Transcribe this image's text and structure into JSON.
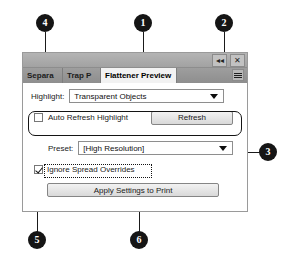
{
  "panel": {
    "titlebar": {
      "collapse_label": "◂◂",
      "close_label": "✕"
    },
    "tabs": [
      {
        "label": "Separa",
        "active": false
      },
      {
        "label": "Trap P",
        "active": false
      },
      {
        "label": "Flattener Preview",
        "active": true
      }
    ],
    "panel_menu_icon": "panel-menu-icon",
    "highlight": {
      "label": "Highlight:",
      "value": "Transparent Objects",
      "caret_icon": "chevron-down-icon"
    },
    "auto_refresh": {
      "label": "Auto Refresh Highlight",
      "checked": false,
      "refresh_button": "Refresh"
    },
    "preset": {
      "label": "Preset:",
      "value": "[High Resolution]",
      "caret_icon": "chevron-down-icon"
    },
    "ignore_spread": {
      "label": "Ignore Spread Overrides",
      "checked": true
    },
    "apply_button": "Apply Settings to Print"
  },
  "callouts": [
    {
      "number": "1"
    },
    {
      "number": "2"
    },
    {
      "number": "3"
    },
    {
      "number": "4"
    },
    {
      "number": "5"
    },
    {
      "number": "6"
    }
  ],
  "colors": {
    "badge_fill": "#151515",
    "badge_text": "#ffffff",
    "panel_border": "#9a9a9a",
    "titlebar": "#ababab",
    "tabbar": "#969696",
    "active_tab": "#f2f2f2"
  }
}
